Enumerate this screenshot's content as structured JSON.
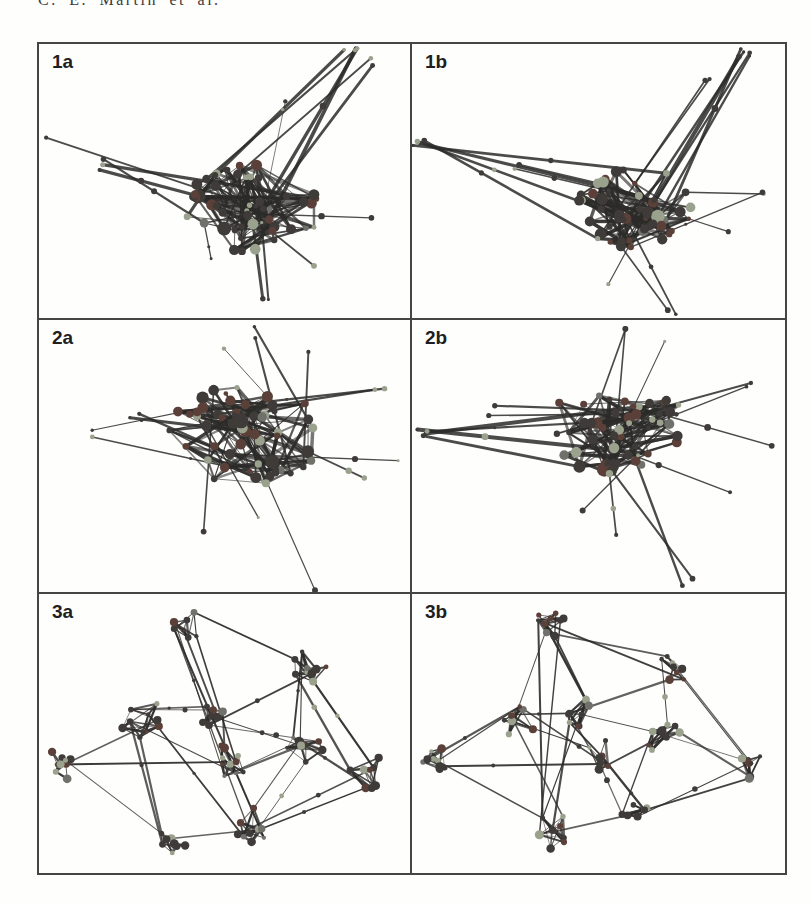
{
  "page": {
    "background": "#fefefd",
    "header": {
      "text": "C. E. Martin et al."
    }
  },
  "figure": {
    "border_color": "#454545",
    "palette": {
      "edge": "#2c2b29",
      "node_dark": "#3e3b38",
      "node_maroon": "#5a4038",
      "node_light": "#9aa18d",
      "node_gray": "#71716c"
    },
    "panels": [
      {
        "label": "1a",
        "kind": "hairball",
        "seed": 7,
        "core": {
          "cx": 0.58,
          "cy": 0.6,
          "rx": 0.19,
          "ry": 0.16,
          "nodes": 52
        },
        "spikes": [
          {
            "x": 0.84,
            "y": 0.035,
            "lines": 4,
            "w": 3.2
          },
          {
            "x": 0.9,
            "y": 0.07,
            "lines": 2,
            "w": 2.2
          },
          {
            "x": 0.68,
            "y": 0.22,
            "lines": 1,
            "w": 1.1
          },
          {
            "x": 0.035,
            "y": 0.33,
            "lines": 1,
            "w": 1.4
          },
          {
            "x": 0.175,
            "y": 0.44,
            "lines": 3,
            "w": 2.8
          },
          {
            "x": 0.62,
            "y": 0.94,
            "lines": 2,
            "w": 2.4
          },
          {
            "x": 0.74,
            "y": 0.82,
            "lines": 1,
            "w": 1.8
          },
          {
            "x": 0.88,
            "y": 0.62,
            "lines": 1,
            "w": 1.3
          },
          {
            "x": 0.47,
            "y": 0.8,
            "lines": 1,
            "w": 1.5
          }
        ]
      },
      {
        "label": "1b",
        "kind": "hairball",
        "seed": 13,
        "core": {
          "cx": 0.6,
          "cy": 0.6,
          "rx": 0.17,
          "ry": 0.15,
          "nodes": 52
        },
        "spikes": [
          {
            "x": 0.895,
            "y": 0.03,
            "lines": 5,
            "w": 3.6
          },
          {
            "x": 0.78,
            "y": 0.13,
            "lines": 2,
            "w": 2.0
          },
          {
            "x": 0.02,
            "y": 0.355,
            "lines": 4,
            "w": 2.8
          },
          {
            "x": 0.27,
            "y": 0.46,
            "lines": 2,
            "w": 2.0
          },
          {
            "x": 0.7,
            "y": 0.965,
            "lines": 2,
            "w": 2.6
          },
          {
            "x": 0.52,
            "y": 0.86,
            "lines": 1,
            "w": 1.4
          },
          {
            "x": 0.93,
            "y": 0.54,
            "lines": 2,
            "w": 1.4
          },
          {
            "x": 0.86,
            "y": 0.7,
            "lines": 1,
            "w": 1.2
          }
        ]
      },
      {
        "label": "2a",
        "kind": "hairball",
        "seed": 23,
        "core": {
          "cx": 0.555,
          "cy": 0.42,
          "rx": 0.21,
          "ry": 0.19,
          "nodes": 58
        },
        "spikes": [
          {
            "x": 0.125,
            "y": 0.425,
            "lines": 2,
            "w": 1.5
          },
          {
            "x": 0.26,
            "y": 0.355,
            "lines": 2,
            "w": 2.4
          },
          {
            "x": 0.595,
            "y": 0.045,
            "lines": 2,
            "w": 1.8
          },
          {
            "x": 0.48,
            "y": 0.12,
            "lines": 1,
            "w": 1.4
          },
          {
            "x": 0.72,
            "y": 0.1,
            "lines": 1,
            "w": 1.6
          },
          {
            "x": 0.915,
            "y": 0.26,
            "lines": 2,
            "w": 2.0
          },
          {
            "x": 0.955,
            "y": 0.5,
            "lines": 1,
            "w": 1.2
          },
          {
            "x": 0.87,
            "y": 0.6,
            "lines": 1,
            "w": 1.6
          },
          {
            "x": 0.735,
            "y": 0.975,
            "lines": 1,
            "w": 1.0
          },
          {
            "x": 0.46,
            "y": 0.76,
            "lines": 1,
            "w": 1.6
          },
          {
            "x": 0.6,
            "y": 0.74,
            "lines": 1,
            "w": 2.0
          }
        ]
      },
      {
        "label": "2b",
        "kind": "hairball",
        "seed": 41,
        "core": {
          "cx": 0.555,
          "cy": 0.4,
          "rx": 0.2,
          "ry": 0.17,
          "nodes": 58
        },
        "spikes": [
          {
            "x": 0.025,
            "y": 0.405,
            "lines": 4,
            "w": 3.2
          },
          {
            "x": 0.21,
            "y": 0.33,
            "lines": 2,
            "w": 2.0
          },
          {
            "x": 0.565,
            "y": 0.04,
            "lines": 2,
            "w": 1.8
          },
          {
            "x": 0.67,
            "y": 0.09,
            "lines": 1,
            "w": 1.4
          },
          {
            "x": 0.9,
            "y": 0.225,
            "lines": 2,
            "w": 2.0
          },
          {
            "x": 0.955,
            "y": 0.48,
            "lines": 1,
            "w": 1.4
          },
          {
            "x": 0.735,
            "y": 0.965,
            "lines": 2,
            "w": 2.4
          },
          {
            "x": 0.55,
            "y": 0.8,
            "lines": 1,
            "w": 1.4
          },
          {
            "x": 0.85,
            "y": 0.64,
            "lines": 1,
            "w": 1.6
          },
          {
            "x": 0.47,
            "y": 0.68,
            "lines": 1,
            "w": 1.2
          }
        ]
      },
      {
        "label": "3a",
        "kind": "modular",
        "seed": 57,
        "clusters": [
          {
            "x": 0.4,
            "y": 0.115,
            "r": 0.052,
            "n": 8
          },
          {
            "x": 0.73,
            "y": 0.265,
            "r": 0.055,
            "n": 9
          },
          {
            "x": 0.275,
            "y": 0.44,
            "r": 0.06,
            "n": 10
          },
          {
            "x": 0.075,
            "y": 0.6,
            "r": 0.052,
            "n": 9
          },
          {
            "x": 0.46,
            "y": 0.43,
            "r": 0.045,
            "n": 7
          },
          {
            "x": 0.52,
            "y": 0.6,
            "r": 0.055,
            "n": 10
          },
          {
            "x": 0.71,
            "y": 0.55,
            "r": 0.055,
            "n": 9
          },
          {
            "x": 0.885,
            "y": 0.635,
            "r": 0.05,
            "n": 8
          },
          {
            "x": 0.575,
            "y": 0.83,
            "r": 0.05,
            "n": 9
          },
          {
            "x": 0.36,
            "y": 0.885,
            "r": 0.048,
            "n": 8
          }
        ],
        "links": [
          [
            0,
            1
          ],
          [
            0,
            4
          ],
          [
            0,
            5
          ],
          [
            0,
            8
          ],
          [
            1,
            6
          ],
          [
            1,
            7
          ],
          [
            1,
            4
          ],
          [
            2,
            4
          ],
          [
            2,
            3
          ],
          [
            2,
            5
          ],
          [
            2,
            9
          ],
          [
            2,
            8
          ],
          [
            3,
            5
          ],
          [
            3,
            9
          ],
          [
            4,
            5
          ],
          [
            4,
            6
          ],
          [
            5,
            6
          ],
          [
            5,
            8
          ],
          [
            6,
            7
          ],
          [
            6,
            8
          ],
          [
            7,
            8
          ],
          [
            8,
            9
          ]
        ]
      },
      {
        "label": "3b",
        "kind": "modular",
        "seed": 71,
        "clusters": [
          {
            "x": 0.37,
            "y": 0.105,
            "r": 0.05,
            "n": 9
          },
          {
            "x": 0.7,
            "y": 0.26,
            "r": 0.05,
            "n": 8
          },
          {
            "x": 0.285,
            "y": 0.445,
            "r": 0.055,
            "n": 9
          },
          {
            "x": 0.065,
            "y": 0.575,
            "r": 0.052,
            "n": 9
          },
          {
            "x": 0.46,
            "y": 0.42,
            "r": 0.05,
            "n": 9
          },
          {
            "x": 0.51,
            "y": 0.58,
            "r": 0.045,
            "n": 7
          },
          {
            "x": 0.675,
            "y": 0.52,
            "r": 0.05,
            "n": 9
          },
          {
            "x": 0.91,
            "y": 0.615,
            "r": 0.048,
            "n": 8
          },
          {
            "x": 0.38,
            "y": 0.85,
            "r": 0.052,
            "n": 10
          },
          {
            "x": 0.6,
            "y": 0.795,
            "r": 0.042,
            "n": 7
          }
        ],
        "links": [
          [
            0,
            1
          ],
          [
            0,
            4
          ],
          [
            0,
            2
          ],
          [
            0,
            8
          ],
          [
            1,
            6
          ],
          [
            1,
            7
          ],
          [
            1,
            4
          ],
          [
            2,
            4
          ],
          [
            2,
            3
          ],
          [
            2,
            5
          ],
          [
            2,
            8
          ],
          [
            3,
            5
          ],
          [
            3,
            8
          ],
          [
            4,
            5
          ],
          [
            4,
            6
          ],
          [
            4,
            8
          ],
          [
            5,
            6
          ],
          [
            5,
            9
          ],
          [
            6,
            7
          ],
          [
            6,
            9
          ],
          [
            7,
            9
          ],
          [
            8,
            9
          ]
        ]
      }
    ]
  }
}
